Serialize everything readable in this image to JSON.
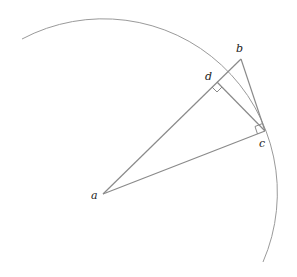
{
  "diagram": {
    "points": {
      "a": {
        "label": "a",
        "x": 103,
        "y": 194
      },
      "b": {
        "label": "b",
        "x": 241,
        "y": 59
      },
      "c": {
        "label": "c",
        "x": 265,
        "y": 131
      },
      "d": {
        "label": "d",
        "x": 217,
        "y": 82
      }
    },
    "labels": {
      "a": "a",
      "b": "b",
      "c": "c",
      "d": "d"
    },
    "segments": [
      "a-b",
      "a-c",
      "b-c",
      "d-c"
    ],
    "right_angles": [
      "at d (between da and dc)",
      "at c (between ca and cb)"
    ],
    "arc": {
      "center": "a",
      "radius": 174
    },
    "colors": {
      "stroke": "#8a8a8a",
      "arc": "#9a9a9a",
      "text": "#222222"
    }
  }
}
